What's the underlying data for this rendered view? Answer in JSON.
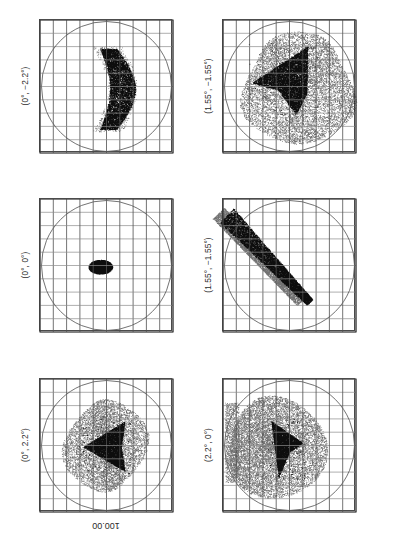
{
  "figure": {
    "type": "spot-diagram-grid",
    "rotation_deg": 180,
    "scale_label": "100.00",
    "scale_units": "microns",
    "grid_divisions": 10,
    "columns": 2,
    "rows": 3,
    "panel_border_color": "#4a4a4a",
    "grid_color": "#4f4f4f",
    "circle_color": "#5a5a5a",
    "spot_color": "#111111"
  },
  "panels": [
    {
      "id": "panel-0-2p2-neg",
      "label": "(0°, −2.2°)",
      "field_x_deg": 0,
      "field_y_deg": -2.2,
      "row": 0,
      "col": 0,
      "shape": "crescent-vertical",
      "core_density": "dense",
      "halo": "light"
    },
    {
      "id": "panel-1p55-neg1p55-top",
      "label": "(1.55°, −1.55°)",
      "field_x_deg": 1.55,
      "field_y_deg": -1.55,
      "row": 0,
      "col": 1,
      "shape": "arrowhead-with-broad-halo",
      "core_density": "dense",
      "halo": "heavy"
    },
    {
      "id": "panel-0-0",
      "label": "(0°, 0°)",
      "field_x_deg": 0,
      "field_y_deg": 0,
      "row": 1,
      "col": 0,
      "shape": "compact-ellipse",
      "core_density": "solid",
      "halo": "none"
    },
    {
      "id": "panel-1p55-neg1p55-mid",
      "label": "(1.55°, −1.55°)",
      "field_x_deg": 1.55,
      "field_y_deg": -1.55,
      "row": 1,
      "col": 1,
      "shape": "diagonal-streak",
      "core_density": "dense",
      "halo": "medium"
    },
    {
      "id": "panel-0-2p2",
      "label": "(0°, 2.2°)",
      "field_x_deg": 0,
      "field_y_deg": 2.2,
      "row": 2,
      "col": 0,
      "shape": "triangular-core-with-scatter",
      "core_density": "dense",
      "halo": "medium"
    },
    {
      "id": "panel-2p2-0",
      "label": "(2.2°, 0°)",
      "field_x_deg": 2.2,
      "field_y_deg": 0,
      "row": 2,
      "col": 1,
      "shape": "wedge-in-disc-halo",
      "core_density": "dense",
      "halo": "heavy"
    }
  ]
}
